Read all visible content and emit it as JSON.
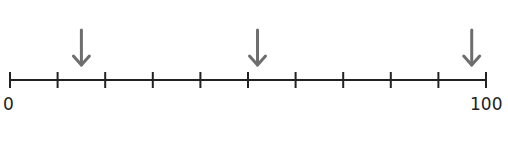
{
  "number_line": {
    "min": 0,
    "max": 100,
    "min_label": "0",
    "max_label": "100",
    "tick_count": 11,
    "tick_step": 10,
    "line_color": "#222222",
    "arrow_color": "#6e6e6e"
  },
  "arrows": [
    {
      "name": "arrow-1",
      "value": 15
    },
    {
      "name": "arrow-2",
      "value": 52
    },
    {
      "name": "arrow-3",
      "value": 97
    }
  ]
}
